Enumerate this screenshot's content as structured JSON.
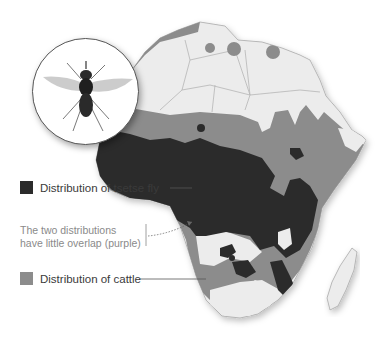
{
  "figure": {
    "inset": {
      "icon": "tsetse-fly-icon"
    },
    "legend": [
      {
        "key": "tsetse",
        "label": "Distribution of tsetse fly",
        "color": "#2b2b2b"
      },
      {
        "key": "cattle",
        "label": "Distribution of cattle",
        "color": "#8c8c8c"
      }
    ],
    "annotation": {
      "line1": "The two distributions",
      "line2": "have little overlap (purple)"
    },
    "colors": {
      "land": "#ececec",
      "border": "#b5b5b5",
      "tsetse": "#2b2b2b",
      "cattle": "#8c8c8c",
      "background": "#ffffff"
    }
  }
}
